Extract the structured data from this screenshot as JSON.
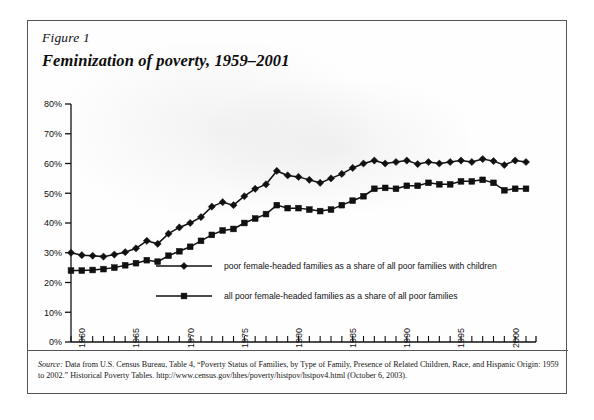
{
  "figure": {
    "number": "Figure 1",
    "title": "Feminization of poverty, 1959–2001"
  },
  "source": {
    "label": "Source:",
    "text": " Data from U.S. Census Bureau, Table 4, “Poverty Status of Families, by Type of Family, Presence of Related Children, Race, and Hispanic Origin: 1959 to 2002.” Historical Poverty Tables. http://www.census.gov/hhes/poverty/histpov/hstpov4.html (October 6, 2003)."
  },
  "chart_data": {
    "type": "line",
    "title": "Feminization of poverty, 1959–2001",
    "xlabel": "",
    "ylabel": "",
    "xlim": [
      1959,
      2001
    ],
    "ylim": [
      0,
      80
    ],
    "ytick_labels": [
      "0%",
      "10%",
      "20%",
      "30%",
      "40%",
      "50%",
      "60%",
      "70%",
      "80%"
    ],
    "ytick_values": [
      0,
      10,
      20,
      30,
      40,
      50,
      60,
      70,
      80
    ],
    "xtick_labels": [
      "1960",
      "1965",
      "1970",
      "1975",
      "1980",
      "1985",
      "1990",
      "1995",
      "2000"
    ],
    "xtick_values": [
      1960,
      1965,
      1970,
      1975,
      1980,
      1985,
      1990,
      1995,
      2000
    ],
    "xtick_minor_every": 1,
    "grid": false,
    "legend_position": "inside-center",
    "x": [
      1959,
      1960,
      1961,
      1962,
      1963,
      1964,
      1965,
      1966,
      1967,
      1968,
      1969,
      1970,
      1971,
      1972,
      1973,
      1974,
      1975,
      1976,
      1977,
      1978,
      1979,
      1980,
      1981,
      1982,
      1983,
      1984,
      1985,
      1986,
      1987,
      1988,
      1989,
      1990,
      1991,
      1992,
      1993,
      1994,
      1995,
      1996,
      1997,
      1998,
      1999,
      2000,
      2001
    ],
    "series": [
      {
        "name": "poor female-headed families as a share of all poor families with children",
        "marker": "diamond",
        "color": "#111111",
        "values": [
          30.0,
          29.2,
          29.0,
          28.7,
          29.4,
          30.2,
          31.5,
          34.0,
          33.0,
          36.4,
          38.5,
          40.0,
          42.0,
          45.5,
          47.0,
          46.0,
          49.0,
          51.5,
          53.0,
          57.5,
          56.0,
          55.5,
          54.5,
          53.5,
          55.0,
          56.5,
          58.5,
          60.0,
          61.0,
          60.0,
          60.5,
          61.0,
          59.8,
          60.5,
          60.0,
          60.5,
          61.0,
          60.5,
          61.5,
          60.8,
          59.5,
          61.0,
          60.5
        ]
      },
      {
        "name": "all poor female-headed families as a share of all poor families",
        "marker": "square",
        "color": "#111111",
        "values": [
          24.0,
          24.0,
          24.2,
          24.5,
          25.0,
          25.8,
          26.5,
          27.5,
          27.0,
          29.0,
          30.5,
          32.0,
          34.0,
          36.0,
          37.5,
          38.0,
          40.0,
          41.5,
          43.0,
          46.0,
          45.0,
          45.0,
          44.5,
          44.0,
          44.5,
          46.0,
          47.5,
          49.0,
          51.5,
          51.8,
          51.5,
          52.5,
          52.5,
          53.5,
          53.0,
          53.0,
          54.0,
          54.0,
          54.5,
          53.5,
          51.0,
          51.5,
          51.5
        ]
      }
    ]
  }
}
